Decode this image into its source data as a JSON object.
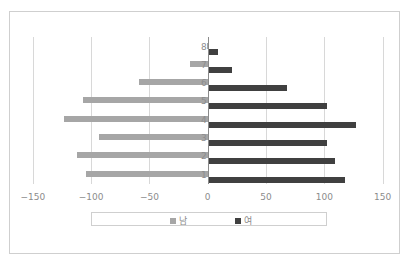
{
  "chart_data": {
    "type": "bar",
    "orientation": "horizontal",
    "title": "",
    "xlabel": "",
    "ylabel": "",
    "categories": [
      "1",
      "2",
      "3",
      "4",
      "5",
      "6",
      "7",
      "8"
    ],
    "series": [
      {
        "name": "남",
        "color": "#a6a6a6",
        "values": [
          -104,
          -112,
          -93,
          -123,
          -107,
          -59,
          -15,
          -1
        ]
      },
      {
        "name": "여",
        "color": "#404040",
        "values": [
          118,
          109,
          102,
          127,
          102,
          68,
          21,
          9
        ]
      }
    ],
    "xlim": [
      -150,
      150
    ],
    "x_ticks": [
      -150,
      -100,
      -50,
      0,
      50,
      100,
      150
    ],
    "x_tick_labels": [
      "-150",
      "-100",
      "-50",
      "0",
      "50",
      "100",
      "150"
    ],
    "grid": true,
    "legend_position": "bottom"
  },
  "legend": {
    "items": [
      {
        "label": "남",
        "color": "#a6a6a6"
      },
      {
        "label": "여",
        "color": "#404040"
      }
    ]
  }
}
